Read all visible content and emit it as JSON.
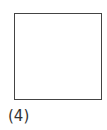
{
  "figure": {
    "label": "(4)",
    "shape": "square",
    "stroke_color": "#444444",
    "fill_color": "#ffffff"
  }
}
